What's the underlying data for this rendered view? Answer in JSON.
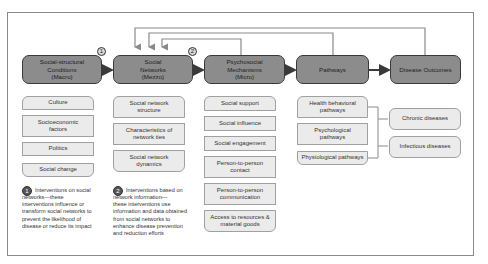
{
  "headers": [
    {
      "label": "Social-structural\nConditions\n(Macro)"
    },
    {
      "label": "Social\nNetworks\n(Mezzo)"
    },
    {
      "label": "Psychosocial\nMechanisms\n(Micro)"
    },
    {
      "label": "Pathways"
    },
    {
      "label": "Disease Outcomes"
    }
  ],
  "markers": {
    "one": "1",
    "two": "2"
  },
  "macro_items": [
    "Culture",
    "Socioeconomic\nfactors",
    "Politics",
    "Social change"
  ],
  "mezzo_items": [
    "Social network\nstructure",
    "Characteristics of\nnetwork ties",
    "Social network\ndynamics"
  ],
  "micro_items": [
    "Social support",
    "Social influence",
    "Social engagement",
    "Person-to-person\ncontact",
    "Person-to-person\ncommunication",
    "Access to resources &\nmaterial goods"
  ],
  "pathway_items": [
    "Health behavioral\npathways",
    "Psychological\npathways",
    "Physiological pathways"
  ],
  "outcome_items": [
    "Chronic diseases",
    "Infectious diseases"
  ],
  "notes": {
    "one": {
      "first": "Interventions on social",
      "rest": "networks—these\ninterventions influence or\ntransform social networks to\nprevent the likelihood of\ndisease or reduce its impact"
    },
    "two": {
      "first": "Interventions based on",
      "rest": "network information—\nthese interventions use\ninformation and data obtained\nfrom social networks to\nenhance disease prevention\nand reduction efforts"
    }
  },
  "colors": {
    "header_fill": "#8c8c8c",
    "item_fill": "#ebebeb",
    "line": "#8a8a8a",
    "arrow": "#3a3a3a"
  }
}
